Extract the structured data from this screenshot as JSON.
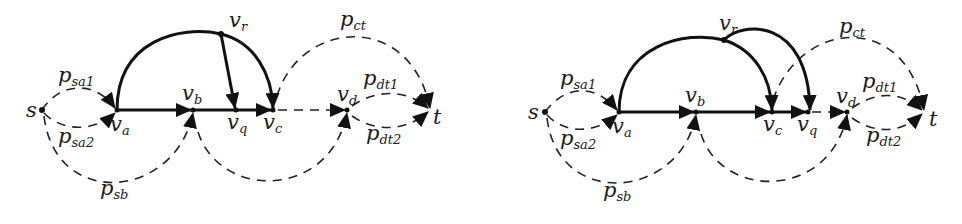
{
  "figure": {
    "panels": [
      {
        "id": "left",
        "nodes": [
          {
            "id": "s",
            "label": "s",
            "sub": ""
          },
          {
            "id": "va",
            "label": "v",
            "sub": "a"
          },
          {
            "id": "vb",
            "label": "v",
            "sub": "b"
          },
          {
            "id": "vr",
            "label": "v",
            "sub": "r"
          },
          {
            "id": "vq",
            "label": "v",
            "sub": "q"
          },
          {
            "id": "vc",
            "label": "v",
            "sub": "c"
          },
          {
            "id": "vd",
            "label": "v",
            "sub": "d"
          },
          {
            "id": "t",
            "label": "t",
            "sub": ""
          }
        ],
        "paths": [
          {
            "id": "psa1",
            "label": "p",
            "sub": "sa1"
          },
          {
            "id": "psa2",
            "label": "p",
            "sub": "sa2"
          },
          {
            "id": "psb",
            "label": "p",
            "sub": "sb"
          },
          {
            "id": "pct",
            "label": "p",
            "sub": "ct"
          },
          {
            "id": "pdt1",
            "label": "p",
            "sub": "dt1"
          },
          {
            "id": "pdt2",
            "label": "p",
            "sub": "dt2"
          }
        ],
        "solid_edges": [
          "va->vb",
          "vb->vq",
          "vq->vc",
          "va-arc-vr-arc->vc",
          "vr->vq"
        ],
        "dashed_edges": [
          "s->va (psa1)",
          "s->va (psa2)",
          "s->vb (psb)",
          "vc->t (pct)",
          "vc->vd",
          "vb->vd",
          "vd->t (pdt1)",
          "vd->t (pdt2)"
        ]
      },
      {
        "id": "right",
        "nodes": [
          {
            "id": "s",
            "label": "s",
            "sub": ""
          },
          {
            "id": "va",
            "label": "v",
            "sub": "a"
          },
          {
            "id": "vb",
            "label": "v",
            "sub": "b"
          },
          {
            "id": "vr",
            "label": "v",
            "sub": "r"
          },
          {
            "id": "vc",
            "label": "v",
            "sub": "c"
          },
          {
            "id": "vq",
            "label": "v",
            "sub": "q"
          },
          {
            "id": "vd",
            "label": "v",
            "sub": "d"
          },
          {
            "id": "t",
            "label": "t",
            "sub": ""
          }
        ],
        "paths": [
          {
            "id": "psa1",
            "label": "p",
            "sub": "sa1"
          },
          {
            "id": "psa2",
            "label": "p",
            "sub": "sa2"
          },
          {
            "id": "psb",
            "label": "p",
            "sub": "sb"
          },
          {
            "id": "pct",
            "label": "p",
            "sub": "ct"
          },
          {
            "id": "pdt1",
            "label": "p",
            "sub": "dt1"
          },
          {
            "id": "pdt2",
            "label": "p",
            "sub": "dt2"
          }
        ],
        "solid_edges": [
          "va->vb",
          "vb->vc",
          "vc->vq",
          "va-arc-vr-arc->vc",
          "vr-arc->vq"
        ],
        "dashed_edges": [
          "s->va (psa1)",
          "s->va (psa2)",
          "s->vb (psb)",
          "vc->t (pct)",
          "vq->vd",
          "vb->vd",
          "vd->t (pdt1)",
          "vd->t (pdt2)"
        ]
      }
    ]
  }
}
